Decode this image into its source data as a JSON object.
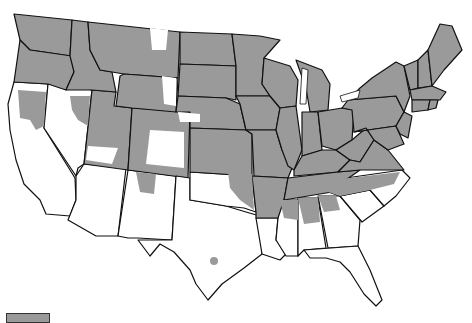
{
  "map": {
    "title": "",
    "region": "Contiguous United States",
    "colors": {
      "shaded": "#9a9a9a",
      "unshaded": "#ffffff",
      "border": "#111111"
    },
    "shaded_states": [
      "WA",
      "OR",
      "ID",
      "MT",
      "WY",
      "ND",
      "SD",
      "NE",
      "KS",
      "MN",
      "IA",
      "MO",
      "WI",
      "IL",
      "MI",
      "IN",
      "OH",
      "KY",
      "TN",
      "WV",
      "VA",
      "PA",
      "NY",
      "VT",
      "NH",
      "ME",
      "MA",
      "CT",
      "RI",
      "NJ",
      "DE",
      "MD",
      "AR"
    ],
    "partially_shaded_states": [
      "CA",
      "NV",
      "UT",
      "CO",
      "NM",
      "OK",
      "MS",
      "AL",
      "GA",
      "NC"
    ],
    "unshaded_states": [
      "AZ",
      "TX",
      "LA",
      "SC",
      "FL"
    ]
  },
  "legend": {
    "items": [
      {
        "label": "",
        "color": "#9a9a9a"
      }
    ]
  }
}
